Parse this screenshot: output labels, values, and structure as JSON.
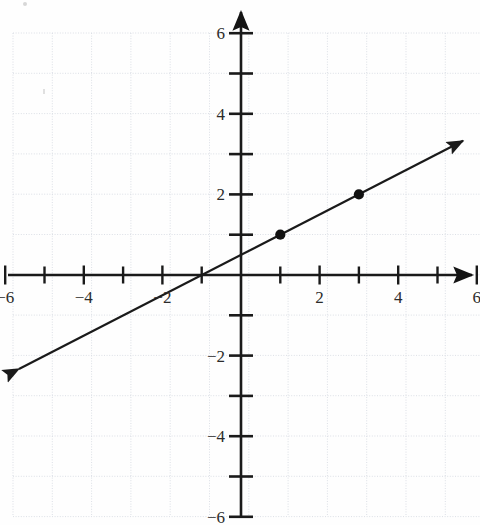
{
  "figure": {
    "background_color": "#fefefe",
    "axis_color": "#1a1a1a",
    "grid_color": "#d9dde4",
    "line_color": "#1a1a1a",
    "point_color": "#111111"
  },
  "axes": {
    "x_label": "",
    "y_label": "",
    "xlim": [
      -6,
      6
    ],
    "ylim": [
      -6,
      6
    ],
    "x_tick_labels": [
      "-6",
      "-4",
      "-2",
      "2",
      "4",
      "6"
    ],
    "x_tick_values": [
      -6,
      -4,
      -2,
      2,
      4,
      6
    ],
    "y_tick_labels": [
      "6",
      "4",
      "2",
      "-2",
      "-4",
      "-6"
    ],
    "y_tick_values": [
      6,
      4,
      2,
      -2,
      -4,
      -6
    ],
    "minor_tick_values": [
      -5,
      -3,
      -1,
      1,
      3,
      5
    ],
    "grid": true,
    "origin_label": ""
  },
  "chart_data": {
    "type": "line",
    "xlabel": "",
    "ylabel": "",
    "xlim": [
      -6,
      6
    ],
    "ylim": [
      -6,
      6
    ],
    "grid": true,
    "legend": false,
    "xticks": [
      -6,
      -5,
      -4,
      -3,
      -2,
      -1,
      1,
      2,
      3,
      4,
      5,
      6
    ],
    "yticks": [
      -6,
      -5,
      -4,
      -3,
      -2,
      -1,
      1,
      2,
      3,
      4,
      5,
      6
    ],
    "xtick_labels": [
      "-6",
      "-4",
      "-2",
      "2",
      "4",
      "6"
    ],
    "ytick_labels": [
      "6",
      "4",
      "2",
      "-2",
      "-4",
      "-6"
    ],
    "series": [
      {
        "name": "line",
        "equation": "y = 0.5x + 0.5",
        "slope": 0.5,
        "intercept": 0.5,
        "x_intercept": -1,
        "y_intercept": 0.5,
        "arrows": "both",
        "endpoints": [
          {
            "x": -5.65,
            "y": -2.33
          },
          {
            "x": 5.65,
            "y": 3.33
          }
        ],
        "marked_points": [
          {
            "x": 1,
            "y": 1,
            "label": "(1, 1)"
          },
          {
            "x": 3,
            "y": 2,
            "label": "(3, 2)"
          }
        ]
      }
    ]
  }
}
